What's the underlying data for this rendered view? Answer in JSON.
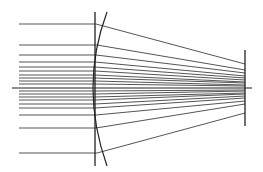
{
  "diagram": {
    "title": "",
    "type": "ray-optics-spherical-aberration",
    "colors": {
      "background": "#ffffff",
      "ray": "#555555",
      "lens": "#222222",
      "axis": "#222222",
      "screen": "#222222"
    },
    "optical_axis": {
      "x1": 12,
      "x2": 252,
      "y": 88
    },
    "lens_plane": {
      "x": 95,
      "y1": 12,
      "y2": 166
    },
    "lens_surface": {
      "top": [
        107,
        12
      ],
      "mid": [
        93,
        88
      ],
      "bottom": [
        107,
        166
      ]
    },
    "screen": {
      "x": 245,
      "y1": 50,
      "y2": 126
    },
    "rays": [
      {
        "y_in": 24,
        "x_start": 19,
        "x_lens": 96,
        "y_end": 64
      },
      {
        "y_in": 45,
        "x_start": 19,
        "x_lens": 97,
        "y_end": 70
      },
      {
        "y_in": 55,
        "x_start": 19,
        "x_lens": 96,
        "y_end": 73
      },
      {
        "y_in": 62,
        "x_start": 19,
        "x_lens": 95,
        "y_end": 76
      },
      {
        "y_in": 67,
        "x_start": 19,
        "x_lens": 95,
        "y_end": 78
      },
      {
        "y_in": 71,
        "x_start": 19,
        "x_lens": 95,
        "y_end": 80
      },
      {
        "y_in": 75,
        "x_start": 19,
        "x_lens": 95,
        "y_end": 82
      },
      {
        "y_in": 78,
        "x_start": 19,
        "x_lens": 95,
        "y_end": 83
      },
      {
        "y_in": 81,
        "x_start": 19,
        "x_lens": 95,
        "y_end": 85
      },
      {
        "y_in": 84,
        "x_start": 19,
        "x_lens": 95,
        "y_end": 86
      },
      {
        "y_in": 91,
        "x_start": 19,
        "x_lens": 95,
        "y_end": 90
      },
      {
        "y_in": 94,
        "x_start": 19,
        "x_lens": 95,
        "y_end": 91
      },
      {
        "y_in": 97,
        "x_start": 19,
        "x_lens": 95,
        "y_end": 93
      },
      {
        "y_in": 100,
        "x_start": 19,
        "x_lens": 95,
        "y_end": 94
      },
      {
        "y_in": 104,
        "x_start": 19,
        "x_lens": 95,
        "y_end": 96
      },
      {
        "y_in": 108,
        "x_start": 19,
        "x_lens": 95,
        "y_end": 98
      },
      {
        "y_in": 115,
        "x_start": 19,
        "x_lens": 96,
        "y_end": 101
      },
      {
        "y_in": 128,
        "x_start": 19,
        "x_lens": 96,
        "y_end": 104
      },
      {
        "y_in": 153,
        "x_start": 19,
        "x_lens": 97,
        "y_end": 113
      }
    ]
  }
}
